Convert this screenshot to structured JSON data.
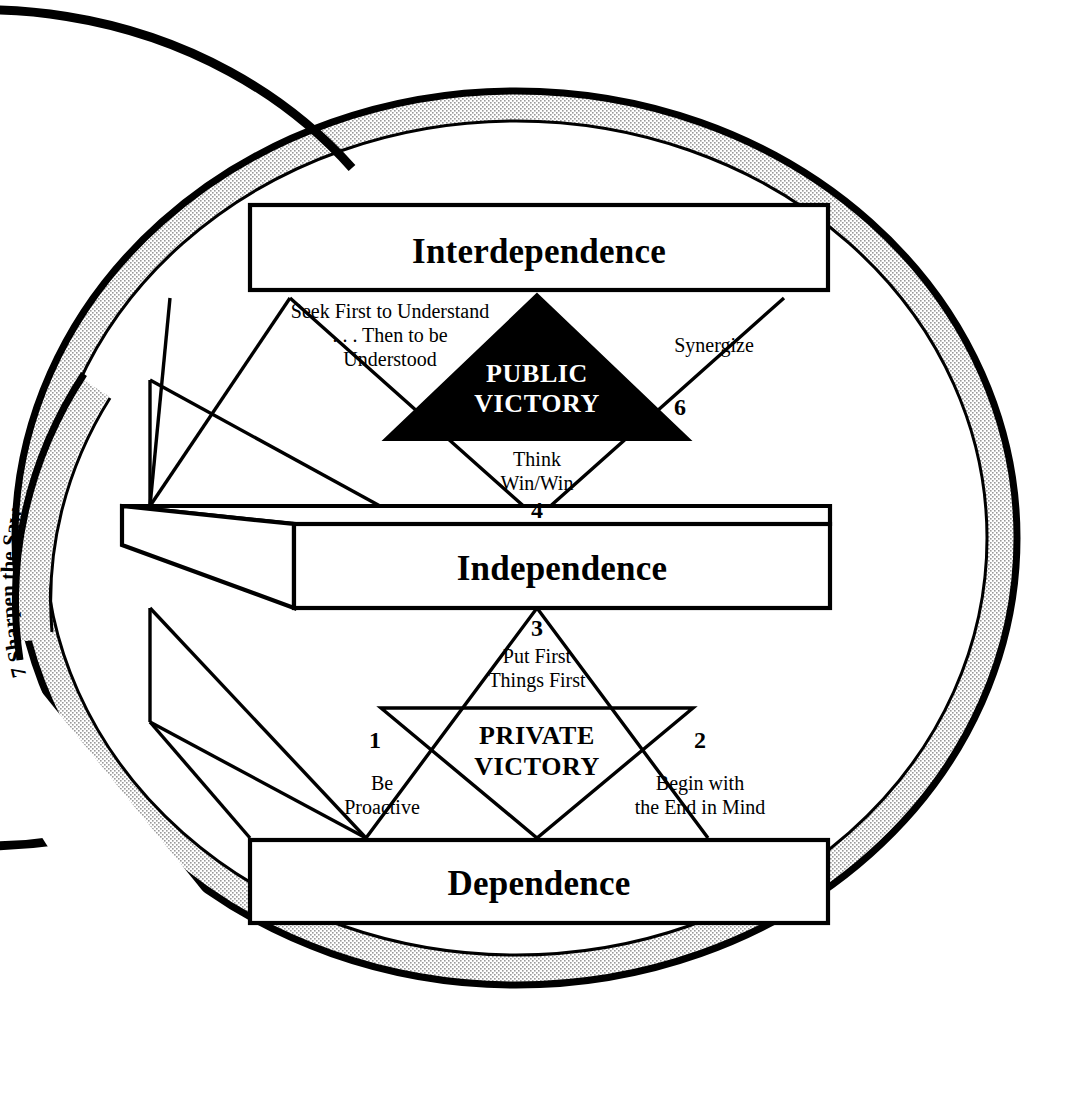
{
  "figure": {
    "title_visible": false,
    "background_color": "#ffffff",
    "ink_color": "#000000",
    "ring_band_color": "#d9d9d9"
  },
  "ring": {
    "habit_number": "7",
    "habit_label": "Sharpen the Saw",
    "full_text": "7  Sharpen the Saw",
    "description_of_shape": "broken outer circle band with stippled gray fill"
  },
  "stages": {
    "top": "Interdependence",
    "middle": "Independence",
    "bottom": "Dependence"
  },
  "public_victory": {
    "heading_line1": "PUBLIC",
    "heading_line2": "VICTORY",
    "fill": "#000000",
    "text_color": "#ffffff"
  },
  "private_victory": {
    "heading_line1": "PRIVATE",
    "heading_line2": "VICTORY",
    "fill": "#ffffff",
    "text_color": "#000000"
  },
  "habits": [
    {
      "number": "1",
      "lines": [
        "Be",
        "Proactive"
      ],
      "group": "private"
    },
    {
      "number": "2",
      "lines": [
        "Begin with",
        "the End in Mind"
      ],
      "group": "private"
    },
    {
      "number": "3",
      "lines": [
        "Put First",
        "Things First"
      ],
      "group": "private"
    },
    {
      "number": "4",
      "lines": [
        "Think",
        "Win/Win"
      ],
      "group": "public"
    },
    {
      "number": "5",
      "lines": [
        "Seek First to Understand",
        ". . . Then to be",
        "Understood"
      ],
      "group": "public"
    },
    {
      "number": "6",
      "lines": [
        "Synergize"
      ],
      "group": "public"
    },
    {
      "number": "7",
      "lines": [
        "Sharpen the Saw"
      ],
      "group": "renewal"
    }
  ]
}
